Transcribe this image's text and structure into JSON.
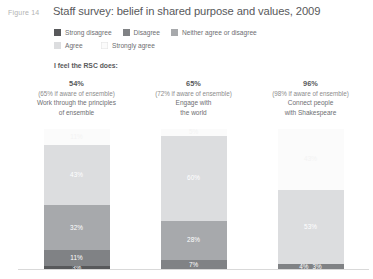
{
  "figure": {
    "label": "Figure 14",
    "title": "Staff survey: belief in shared purpose and values, 2009",
    "intro": "I feel the RSC does:"
  },
  "legend": {
    "items": [
      {
        "label": "Strong disagree",
        "color": "#58595b"
      },
      {
        "label": "Disagree",
        "color": "#808285"
      },
      {
        "label": "Neither agree or disagree",
        "color": "#a7a9ac"
      },
      {
        "label": "Agree",
        "color": "#dcdddf"
      },
      {
        "label": "Strongly agree",
        "color": "#fbfbfb"
      }
    ]
  },
  "columns": [
    {
      "pct": "54%",
      "sub": "(65% if aware of ensemble)",
      "desc_line1": "Work through the principles",
      "desc_line2": "of ensemble"
    },
    {
      "pct": "65%",
      "sub": "(72% if aware of ensemble)",
      "desc_line1": "Engage with",
      "desc_line2": "the world"
    },
    {
      "pct": "96%",
      "sub": "(98% if aware of ensemble)",
      "desc_line1": "Connect people",
      "desc_line2": "with Shakespeare"
    }
  ],
  "chart_data": {
    "type": "bar",
    "subtype": "stacked-100-percent",
    "title": "Staff survey: belief in shared purpose and values, 2009",
    "xlabel": "",
    "ylabel": "",
    "ylim": [
      0,
      100
    ],
    "grid": false,
    "legend_position": "top",
    "categories": [
      "Work through the principles of ensemble",
      "Engage with the world",
      "Connect people with Shakespeare"
    ],
    "series": [
      {
        "name": "Strong disagree",
        "color": "#58595b",
        "values": [
          3,
          1,
          3
        ]
      },
      {
        "name": "Disagree",
        "color": "#808285",
        "values": [
          11,
          7,
          4
        ]
      },
      {
        "name": "Neither agree or disagree",
        "color": "#a7a9ac",
        "values": [
          32,
          28,
          0
        ]
      },
      {
        "name": "Agree",
        "color": "#dcdddf",
        "values": [
          43,
          60,
          53
        ]
      },
      {
        "name": "Strongly agree",
        "color": "#fbfbfb",
        "values": [
          11,
          5,
          43
        ]
      }
    ],
    "bars": [
      {
        "category": "Work through the principles of ensemble",
        "segments": [
          {
            "name": "Strongly agree",
            "value": 11,
            "label": "11%",
            "color": "#fbfbfb",
            "label_light": true
          },
          {
            "name": "Agree",
            "value": 43,
            "label": "43%",
            "color": "#dcdddf",
            "label_light": false
          },
          {
            "name": "Neither agree or disagree",
            "value": 32,
            "label": "32%",
            "color": "#a7a9ac",
            "label_light": false
          },
          {
            "name": "Disagree",
            "value": 11,
            "label": "11%",
            "color": "#808285",
            "label_light": false
          },
          {
            "name": "Strong disagree",
            "value": 3,
            "label": "3%",
            "color": "#58595b",
            "label_light": false
          }
        ]
      },
      {
        "category": "Engage with the world",
        "segments": [
          {
            "name": "Strongly agree",
            "value": 5,
            "label": "5%",
            "color": "#fbfbfb",
            "label_light": true
          },
          {
            "name": "Agree",
            "value": 60,
            "label": "60%",
            "color": "#dcdddf",
            "label_light": false
          },
          {
            "name": "Neither agree or disagree",
            "value": 28,
            "label": "28%",
            "color": "#a7a9ac",
            "label_light": false
          },
          {
            "name": "Disagree",
            "value": 7,
            "label": "7%",
            "color": "#808285",
            "label_light": false
          }
        ]
      },
      {
        "category": "Connect people with Shakespeare",
        "segments": [
          {
            "name": "Strongly agree",
            "value": 43,
            "label": "43%",
            "color": "#fbfbfb",
            "label_light": true
          },
          {
            "name": "Agree",
            "value": 53,
            "label": "53%",
            "color": "#dcdddf",
            "label_light": false
          }
        ],
        "footer_labels": [
          "4%",
          "3%"
        ],
        "footer_color": "#808285"
      }
    ]
  }
}
